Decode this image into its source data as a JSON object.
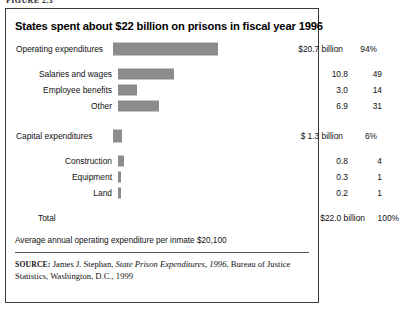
{
  "figure": {
    "caption_cutoff": "FIGURE 2.3",
    "title": "States spent about $22 billion on prisons in fiscal year 1996",
    "note": "Average annual operating expenditure per inmate $20,100",
    "source": {
      "keyword": "SOURCE:",
      "author": "James J. Stephan,",
      "publication": "State Prison Expenditures, 1996",
      "publisher": ", Bureau of Justice Statistics, Washington, D.C., 1999"
    },
    "colors": {
      "bar_fill": "#8c8c8c",
      "frame": "#3a3a3a",
      "rule": "#5a5a5a",
      "text": "#111111"
    }
  },
  "chart_data": {
    "type": "bar",
    "title": "States spent about $22 billion on prisons in fiscal year 1996",
    "xlabel": "",
    "ylabel": "",
    "orientation": "horizontal",
    "grid": false,
    "legend": "none",
    "value_unit": "billions of dollars",
    "xlim": [
      0,
      22
    ],
    "categories": [
      "Operating expenditures",
      "Salaries and wages",
      "Employee benefits",
      "Other",
      "Capital expenditures",
      "Construction",
      "Equipment",
      "Land"
    ],
    "values": [
      20.7,
      10.8,
      3.0,
      6.9,
      1.3,
      0.8,
      0.3,
      0.2
    ],
    "percents": [
      94,
      49,
      14,
      31,
      6,
      4,
      1,
      1
    ],
    "total": {
      "label": "Total",
      "value": "$22.0 billion",
      "percent": "100%"
    }
  },
  "rows": {
    "operating": {
      "label": "Operating expenditures",
      "value": "$20.7 billion",
      "pct": "94%",
      "bar_px": 105
    },
    "salaries": {
      "label": "Salaries and wages",
      "value": "10.8",
      "pct": "49",
      "bar_px": 56
    },
    "benefits": {
      "label": "Employee benefits",
      "value": "3.0",
      "pct": "14",
      "bar_px": 19
    },
    "other": {
      "label": "Other",
      "value": "6.9",
      "pct": "31",
      "bar_px": 41
    },
    "capital": {
      "label": "Capital expenditures",
      "value": "$ 1.3 billion",
      "pct": "6%",
      "bar_px": 9
    },
    "construction": {
      "label": "Construction",
      "value": "0.8",
      "pct": "4",
      "bar_px": 6
    },
    "equipment": {
      "label": "Equipment",
      "value": "0.3",
      "pct": "1",
      "bar_px": 3
    },
    "land": {
      "label": "Land",
      "value": "0.2",
      "pct": "1",
      "bar_px": 3
    },
    "total": {
      "label": "Total",
      "value": "$22.0 billion",
      "pct": "100%"
    }
  }
}
